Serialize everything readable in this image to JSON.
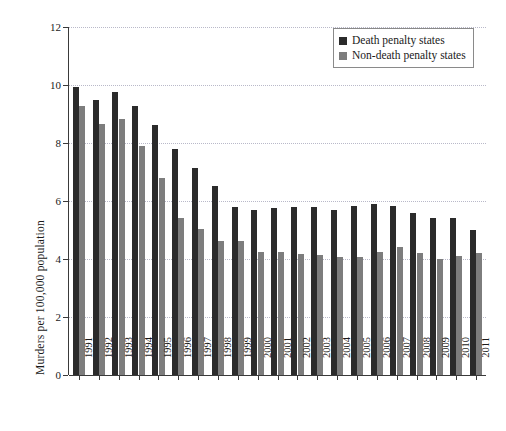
{
  "chart_data": {
    "type": "bar",
    "title": "",
    "xlabel": "",
    "ylabel": "Murders per 100,000 population",
    "ylim": [
      0,
      12
    ],
    "yticks": [
      0,
      2,
      4,
      6,
      8,
      10,
      12
    ],
    "grid": true,
    "legend_position": "top-right",
    "categories": [
      "1991",
      "1992",
      "1993",
      "1994",
      "1995",
      "1996",
      "1997",
      "1998",
      "1999",
      "2000",
      "2001",
      "2002",
      "2003",
      "2004",
      "2005",
      "2006",
      "2007",
      "2008",
      "2009",
      "2010",
      "2011"
    ],
    "series": [
      {
        "name": "Death penalty states",
        "color": "#2b2b2b",
        "values": [
          9.94,
          9.5,
          9.75,
          9.27,
          8.62,
          7.78,
          7.15,
          6.52,
          5.78,
          5.7,
          5.75,
          5.8,
          5.78,
          5.7,
          5.82,
          5.9,
          5.82,
          5.6,
          5.4,
          5.4,
          5.0
        ]
      },
      {
        "name": "Non-death penalty states",
        "color": "#7d7d7d",
        "values": [
          9.27,
          8.65,
          8.82,
          7.9,
          6.78,
          5.4,
          5.05,
          4.62,
          4.62,
          4.25,
          4.25,
          4.18,
          4.15,
          4.08,
          4.08,
          4.25,
          4.42,
          4.2,
          4.0,
          4.1,
          4.22
        ]
      }
    ]
  },
  "legend": {
    "items": [
      {
        "label": "Death penalty states",
        "swatch": "dark"
      },
      {
        "label": "Non-death penalty states",
        "swatch": "light"
      }
    ]
  }
}
